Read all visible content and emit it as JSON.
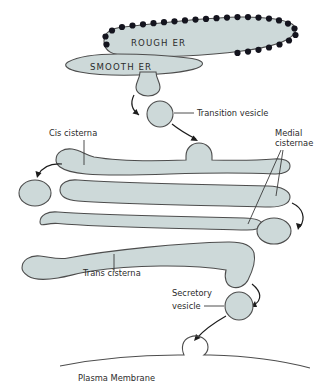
{
  "diagram": {
    "colors": {
      "organelle_fill": "#cdd9d9",
      "organelle_stroke": "#4d4d4d",
      "ribosome": "#14141e",
      "label_text": "#2b2b2b",
      "background": "#ffffff"
    },
    "labels": {
      "rough_er": "ROUGH  ER",
      "smooth_er": "SMOOTH  ER",
      "transition_vesicle": "Transition vesicle",
      "cis_cisterna": "Cis cisterna",
      "medial_cisternae_line1": "Medial",
      "medial_cisternae_line2": "cisternae",
      "trans_cisterna": "Trans cisterna",
      "secretory_vesicle_line1": "Secretory",
      "secretory_vesicle_line2": "vesicle",
      "plasma_membrane": "Plasma Membrane"
    },
    "structures": [
      {
        "name": "rough-er",
        "kind": "membrane-sac",
        "ribosomes": true
      },
      {
        "name": "smooth-er",
        "kind": "membrane-sac",
        "ribosomes": false
      },
      {
        "name": "transition-vesicle",
        "kind": "vesicle"
      },
      {
        "name": "cis-cisterna",
        "kind": "cisterna",
        "position": 1
      },
      {
        "name": "medial-cisterna-upper",
        "kind": "cisterna",
        "position": 2
      },
      {
        "name": "medial-cisterna-lower",
        "kind": "cisterna",
        "position": 3
      },
      {
        "name": "trans-cisterna",
        "kind": "cisterna",
        "position": 4
      },
      {
        "name": "vesicle-left-upper",
        "kind": "vesicle"
      },
      {
        "name": "vesicle-right-upper",
        "kind": "vesicle"
      },
      {
        "name": "vesicle-right-lower",
        "kind": "vesicle"
      },
      {
        "name": "secretory-vesicle",
        "kind": "vesicle"
      },
      {
        "name": "plasma-membrane",
        "kind": "membrane-line",
        "fusion_pore": true
      }
    ],
    "flow_arrows": [
      {
        "from": "rough-er",
        "to": "transition-vesicle"
      },
      {
        "from": "transition-vesicle",
        "to": "cis-cisterna"
      },
      {
        "from": "cis-cisterna",
        "to": "vesicle-left-upper"
      },
      {
        "from": "medial-cisterna-upper",
        "to": "vesicle-right-lower"
      },
      {
        "from": "trans-cisterna",
        "to": "secretory-vesicle"
      },
      {
        "from": "secretory-vesicle",
        "to": "plasma-membrane"
      }
    ]
  }
}
